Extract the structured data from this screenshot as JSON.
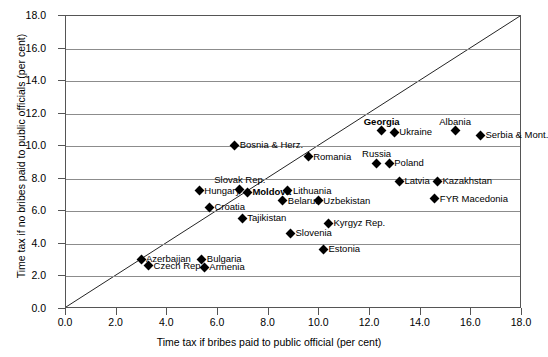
{
  "chart_data": {
    "type": "scatter",
    "title": "",
    "xlabel": "Time tax if bribes paid to public official (per cent)",
    "ylabel": "Time tax if no bribes paid to public officials (per cent)",
    "xlim": [
      0.0,
      18.0
    ],
    "ylim": [
      0.0,
      18.0
    ],
    "xticks": [
      "0.0",
      "2.0",
      "4.0",
      "6.0",
      "8.0",
      "10.0",
      "12.0",
      "14.0",
      "16.0",
      "18.0"
    ],
    "yticks": [
      "0.0",
      "2.0",
      "4.0",
      "6.0",
      "8.0",
      "10.0",
      "12.0",
      "14.0",
      "16.0",
      "18.0"
    ],
    "grid": "horizontal",
    "legend": "none",
    "reference_line": {
      "type": "45-degree",
      "from": [
        0.0,
        0.0
      ],
      "to": [
        18.0,
        18.0
      ]
    },
    "marker": "filled-diamond",
    "marker_color": "#000000",
    "points": [
      {
        "label": "Bosnia & Herz.",
        "x": 6.7,
        "y": 10.0,
        "label_pos": "right",
        "bold": false
      },
      {
        "label": "Romania",
        "x": 9.6,
        "y": 9.3,
        "label_pos": "right",
        "bold": false
      },
      {
        "label": "Georgia",
        "x": 12.5,
        "y": 10.9,
        "label_pos": "above",
        "bold": true
      },
      {
        "label": "Ukraine",
        "x": 13.0,
        "y": 10.8,
        "label_pos": "right",
        "bold": false
      },
      {
        "label": "Albania",
        "x": 15.4,
        "y": 10.9,
        "label_pos": "above",
        "bold": false
      },
      {
        "label": "Serbia & Mont.",
        "x": 16.4,
        "y": 10.6,
        "label_pos": "right",
        "bold": false
      },
      {
        "label": "Russia",
        "x": 12.3,
        "y": 8.9,
        "label_pos": "above",
        "bold": false
      },
      {
        "label": "Poland",
        "x": 12.8,
        "y": 8.9,
        "label_pos": "right",
        "bold": false
      },
      {
        "label": "Latvia",
        "x": 13.2,
        "y": 7.8,
        "label_pos": "right",
        "bold": false
      },
      {
        "label": "Kazakhstan",
        "x": 14.7,
        "y": 7.8,
        "label_pos": "right",
        "bold": false
      },
      {
        "label": "FYR Macedonia",
        "x": 14.6,
        "y": 6.7,
        "label_pos": "right",
        "bold": false
      },
      {
        "label": "Hungary",
        "x": 5.3,
        "y": 7.2,
        "label_pos": "right",
        "bold": false
      },
      {
        "label": "Slovak Rep.",
        "x": 6.9,
        "y": 7.3,
        "label_pos": "above",
        "bold": false
      },
      {
        "label": "Moldova",
        "x": 7.2,
        "y": 7.1,
        "label_pos": "right",
        "bold": true
      },
      {
        "label": "Lithuania",
        "x": 8.8,
        "y": 7.2,
        "label_pos": "right",
        "bold": false
      },
      {
        "label": "Belarus",
        "x": 8.6,
        "y": 6.6,
        "label_pos": "right",
        "bold": false
      },
      {
        "label": "Uzbekistan",
        "x": 10.0,
        "y": 6.6,
        "label_pos": "right",
        "bold": false
      },
      {
        "label": "Croatia",
        "x": 5.7,
        "y": 6.2,
        "label_pos": "right",
        "bold": false
      },
      {
        "label": "Tajikistan",
        "x": 7.0,
        "y": 5.5,
        "label_pos": "right",
        "bold": false
      },
      {
        "label": "Kyrgyz Rep.",
        "x": 10.4,
        "y": 5.2,
        "label_pos": "right",
        "bold": false
      },
      {
        "label": "Slovenia",
        "x": 8.9,
        "y": 4.6,
        "label_pos": "right",
        "bold": false
      },
      {
        "label": "Estonia",
        "x": 10.2,
        "y": 3.6,
        "label_pos": "right",
        "bold": false
      },
      {
        "label": "Azerbaijan",
        "x": 3.0,
        "y": 3.0,
        "label_pos": "right",
        "bold": false
      },
      {
        "label": "Czech Rep.",
        "x": 3.3,
        "y": 2.6,
        "label_pos": "right",
        "bold": false
      },
      {
        "label": "Bulgaria",
        "x": 5.4,
        "y": 3.0,
        "label_pos": "right",
        "bold": false
      },
      {
        "label": "Armenia",
        "x": 5.5,
        "y": 2.5,
        "label_pos": "right",
        "bold": false
      }
    ]
  }
}
